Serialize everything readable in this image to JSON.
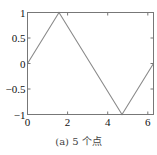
{
  "chart_data": {
    "type": "line",
    "title": "",
    "xlabel": "",
    "ylabel": "",
    "x": [
      0,
      1.5708,
      3.1416,
      4.7124,
      6.2832
    ],
    "series": [
      {
        "name": "sin(x)",
        "values": [
          0,
          1,
          0,
          -1,
          0
        ],
        "color": "#8a8a8a"
      }
    ],
    "xlim": [
      0,
      6.2832
    ],
    "ylim": [
      -1,
      1
    ],
    "xticks": [
      0,
      2,
      4,
      6
    ],
    "xtick_labels": [
      "0",
      "2",
      "4",
      "6"
    ],
    "yticks": [
      1,
      0.5,
      0,
      -0.5,
      -1
    ],
    "ytick_labels": [
      "1",
      "0.5",
      "0",
      "−0.5",
      "−1"
    ],
    "grid": false,
    "legend": null,
    "caption": "(a) 5 个点"
  },
  "colors": {
    "axes": "#777777",
    "line": "#8a8a8a",
    "text": "#111111"
  }
}
